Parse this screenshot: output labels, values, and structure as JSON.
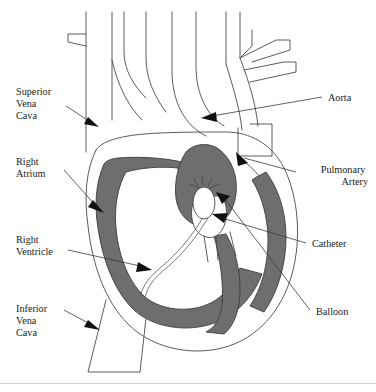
{
  "figure": {
    "colors": {
      "myocardium": "#6e6e6e",
      "outline": "#4a4a4a",
      "leader": "#3a3a3a",
      "arrowhead": "#111111",
      "lumen": "#ffffff",
      "background": "#ffffff",
      "baseline_rule": "#cfcfcf"
    }
  },
  "labels": {
    "superior_vena_cava": {
      "text": "Superior\nVena\nCava",
      "lines": [
        "Superior",
        "Vena",
        "Cava"
      ],
      "align": "left",
      "x": 16,
      "y": 95
    },
    "right_atrium": {
      "text": "Right\nAtrium",
      "lines": [
        "Right",
        "Atrium"
      ],
      "align": "left",
      "x": 16,
      "y": 165
    },
    "right_ventricle": {
      "text": "Right\nVentricle",
      "lines": [
        "Right",
        "Ventricle"
      ],
      "align": "left",
      "x": 16,
      "y": 243
    },
    "inferior_vena_cava": {
      "text": "Inferior\nVena\nCava",
      "lines": [
        "Inferior",
        "Vena",
        "Cava"
      ],
      "align": "left",
      "x": 16,
      "y": 312
    },
    "aorta": {
      "text": "Aorta",
      "lines": [
        "Aorta"
      ],
      "align": "left",
      "x": 328,
      "y": 101
    },
    "pulmonary_artery": {
      "text": "Pulmonary\nArtery",
      "lines": [
        "Pulmonary",
        "Artery"
      ],
      "align": "right",
      "x": 368,
      "y": 173
    },
    "catheter": {
      "text": "Catheter",
      "lines": [
        "Catheter"
      ],
      "align": "left",
      "x": 312,
      "y": 247
    },
    "balloon": {
      "text": "Balloon",
      "lines": [
        "Balloon"
      ],
      "align": "left",
      "x": 316,
      "y": 315
    }
  }
}
